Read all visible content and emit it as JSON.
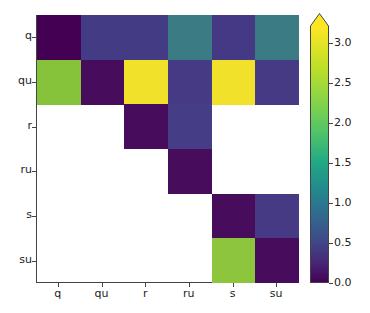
{
  "chart_data": {
    "type": "heatmap",
    "title": "",
    "xlabel": "",
    "ylabel": "",
    "x_categories": [
      "q",
      "qu",
      "r",
      "ru",
      "s",
      "su"
    ],
    "y_categories": [
      "q",
      "qu",
      "r",
      "ru",
      "s",
      "su"
    ],
    "colormap": "viridis",
    "values": [
      [
        0.05,
        0.7,
        0.7,
        1.5,
        0.6,
        1.5
      ],
      [
        2.5,
        0.1,
        3.1,
        0.6,
        3.1,
        0.6
      ],
      [
        null,
        null,
        0.1,
        0.65,
        null,
        null
      ],
      [
        null,
        null,
        null,
        0.1,
        null,
        null
      ],
      [
        null,
        null,
        null,
        null,
        0.1,
        0.6
      ],
      [
        null,
        null,
        null,
        null,
        2.6,
        0.1
      ]
    ],
    "colorbar": {
      "ticks": [
        "0.0",
        "0.5",
        "1.0",
        "1.5",
        "2.0",
        "2.5",
        "3.0"
      ],
      "range": [
        0.0,
        3.2
      ],
      "extend": "max"
    },
    "grid": false,
    "legend": "none"
  },
  "colors": {
    "c_0_0": "#440154",
    "c_0_1": "#433b83",
    "c_0_2": "#433b83",
    "c_0_3": "#3b7b83",
    "c_0_4": "#453884",
    "c_0_5": "#3b7b83",
    "c_1_0": "#86c23a",
    "c_1_1": "#470d5c",
    "c_1_2": "#f2e12a",
    "c_1_3": "#463a85",
    "c_1_4": "#f2e12a",
    "c_1_5": "#463a85",
    "c_2_2": "#470d5c",
    "c_2_3": "#453e86",
    "c_3_3": "#470d5c",
    "c_4_4": "#470d5c",
    "c_4_5": "#463a85",
    "c_5_4": "#8dc63c",
    "c_5_5": "#470d5c"
  }
}
